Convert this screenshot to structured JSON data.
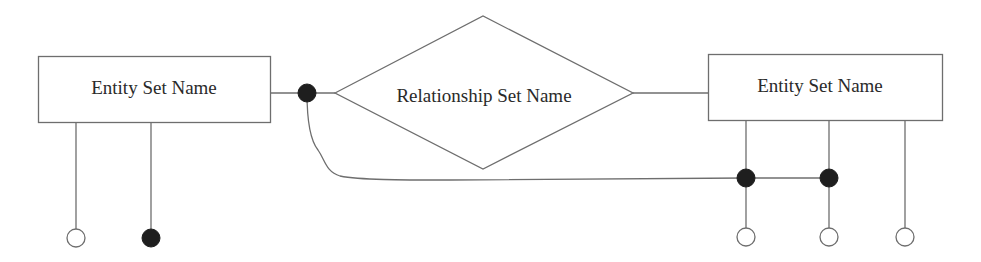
{
  "diagram": {
    "type": "entity-relationship",
    "entities": [
      {
        "id": "left-entity",
        "label": "Entity Set Name"
      },
      {
        "id": "right-entity",
        "label": "Entity Set Name"
      }
    ],
    "relationship": {
      "id": "relationship",
      "label": "Relationship Set Name"
    },
    "attributes": [
      {
        "entity": "left-entity",
        "style": "open"
      },
      {
        "entity": "left-entity",
        "style": "filled"
      },
      {
        "entity": "right-entity",
        "style": "open"
      },
      {
        "entity": "right-entity",
        "style": "open"
      },
      {
        "entity": "right-entity",
        "style": "open"
      }
    ],
    "key_markers": [
      {
        "on": "left-entity-to-relationship-link",
        "style": "filled"
      },
      {
        "on": "right-entity-attribute-1",
        "style": "filled"
      },
      {
        "on": "right-entity-attribute-2",
        "style": "filled"
      }
    ],
    "colors": {
      "stroke": "#6e6e6e",
      "filled_marker": "#1e1e1e",
      "text": "#2a2a2a",
      "background": "#ffffff"
    }
  }
}
